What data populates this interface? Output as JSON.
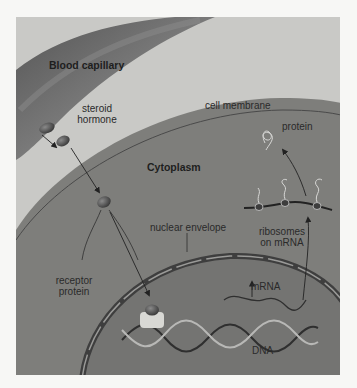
{
  "diagram": {
    "labels": {
      "blood_capillary": "Blood capillary",
      "steroid_hormone_line1": "steroid",
      "steroid_hormone_line2": "hormone",
      "cell_membrane": "cell membrane",
      "protein": "protein",
      "cytoplasm": "Cytoplasm",
      "ribosomes_line1": "ribosomes",
      "ribosomes_line2": "on mRNA",
      "nuclear_envelope": "nuclear envelope",
      "receptor_line1": "receptor",
      "receptor_line2": "protein",
      "mrna": "mRNA",
      "dna": "DNA"
    },
    "colors": {
      "page_bg": "#f7f7f5",
      "frame_bg": "#c9c9c6",
      "capillary": "#5e5e5e",
      "cytoplasm": "#7d7d7a",
      "nucleus": "#727270",
      "envelope": "#474747",
      "hormone": "#3f3f3f",
      "arrow": "#2a2a2a"
    },
    "flow": [
      "steroid hormone leaves blood capillary",
      "hormone crosses cell membrane into cytoplasm",
      "hormone binds receptor protein",
      "hormone-receptor complex enters nucleus and binds DNA",
      "DNA transcribed to mRNA",
      "mRNA exits nucleus to ribosomes",
      "ribosomes translate protein"
    ]
  }
}
